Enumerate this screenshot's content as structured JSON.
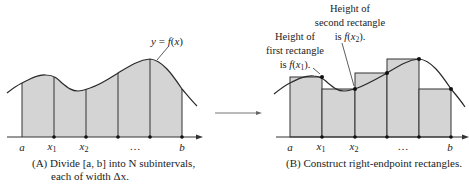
{
  "colors": {
    "fill": "#d4d4d4",
    "stroke": "#333333",
    "curve": "#2a2a2a",
    "text": "#222222",
    "arrow": "#666666"
  },
  "panelA": {
    "curve_label": "y = f(x)",
    "tick_labels": [
      "a",
      "x1",
      "x2",
      "…",
      "b"
    ],
    "caption_line1": "(A) Divide [a, b] into N subintervals,",
    "caption_line2": "each of width Δx."
  },
  "panelB": {
    "note_first": [
      "Height of",
      "first rectangle",
      "is f(x1)."
    ],
    "note_second": [
      "Height of",
      "second rectangle",
      "is f(x2)."
    ],
    "tick_labels": [
      "a",
      "x1",
      "x2",
      "…",
      "b"
    ],
    "caption": "(B)  Construct right-endpoint rectangles."
  }
}
